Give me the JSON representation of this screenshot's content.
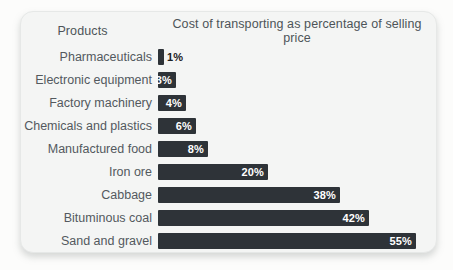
{
  "page": {
    "background": "#fcfcfb"
  },
  "card": {
    "background": "#f4f5f4",
    "border_color": "#e6e8e7"
  },
  "chart_data": {
    "type": "bar",
    "orientation": "horizontal",
    "column_header": "Products",
    "title": "Cost of transporting as percentage of selling price",
    "categories": [
      "Pharmaceuticals",
      "Electronic equipment",
      "Factory machinery",
      "Chemicals and plastics",
      "Manufactured food",
      "Iron ore",
      "Cabbage",
      "Bituminous coal",
      "Sand and gravel"
    ],
    "values": [
      1,
      3,
      4,
      6,
      8,
      20,
      38,
      42,
      55
    ],
    "value_labels": [
      "1%",
      "3%",
      "4%",
      "6%",
      "8%",
      "20%",
      "38%",
      "42%",
      "55%"
    ],
    "xlim": [
      0,
      57
    ],
    "bar_color": "#2e3338",
    "category_label_color": "#53595e",
    "inside_value_label_color": "#ffffff",
    "outside_value_label_color": "#1c2023",
    "grid": false,
    "legend": "none",
    "bar_px": [
      6,
      18,
      28,
      38,
      50,
      110,
      182,
      211,
      258
    ]
  }
}
